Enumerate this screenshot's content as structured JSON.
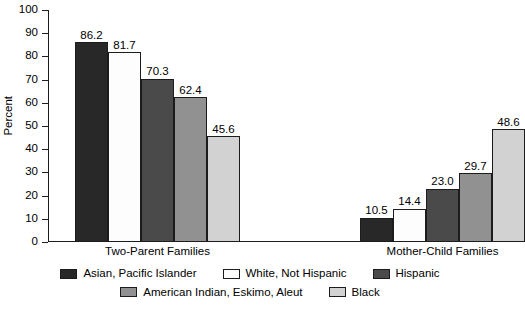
{
  "chart_data": {
    "type": "bar",
    "title": "",
    "subtitle": "",
    "xlabel": "",
    "ylabel": "Percent",
    "ylim": [
      0,
      100
    ],
    "yticks": [
      0,
      10,
      20,
      30,
      40,
      50,
      60,
      70,
      80,
      90,
      100
    ],
    "ytick_labels": [
      "0",
      "10",
      "20",
      "30",
      "40",
      "50",
      "60",
      "70",
      "80",
      "90",
      "100"
    ],
    "grid": false,
    "legend_position": "bottom",
    "categories": [
      "Two-Parent Families",
      "Mother-Child Families"
    ],
    "series": [
      {
        "name": "Asian, Pacific Islander",
        "color": "#282828",
        "values": [
          86.2,
          10.5
        ],
        "labels": [
          "86.2",
          "10.5"
        ]
      },
      {
        "name": "White, Not Hispanic",
        "color": "#fdfdfd",
        "values": [
          81.7,
          14.4
        ],
        "labels": [
          "81.7",
          "14.4"
        ]
      },
      {
        "name": "Hispanic",
        "color": "#4a4a4a",
        "values": [
          70.3,
          23.0
        ],
        "labels": [
          "70.3",
          "23.0"
        ]
      },
      {
        "name": "American Indian, Eskimo, Aleut",
        "color": "#919191",
        "values": [
          62.4,
          29.7
        ],
        "labels": [
          "62.4",
          "29.7"
        ]
      },
      {
        "name": "Black",
        "color": "#d2d2d2",
        "values": [
          45.6,
          48.6
        ],
        "labels": [
          "45.6",
          "48.6"
        ]
      }
    ]
  },
  "style": {
    "axis_color": "#1c1c1c",
    "background": "#ffffff",
    "text_color": "#000000"
  }
}
